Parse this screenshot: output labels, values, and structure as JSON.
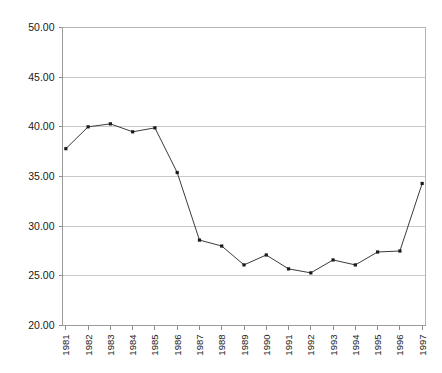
{
  "chart_data": {
    "type": "line",
    "title": "",
    "subtitle": "",
    "xlabel": "",
    "ylabel": "",
    "categories": [
      "1981",
      "1982",
      "1983",
      "1984",
      "1985",
      "1986",
      "1987",
      "1988",
      "1989",
      "1990",
      "1991",
      "1992",
      "1993",
      "1994",
      "1995",
      "1996",
      "1997"
    ],
    "values": [
      37.8,
      40.0,
      40.3,
      39.5,
      39.9,
      35.4,
      28.6,
      28.0,
      26.1,
      27.1,
      25.7,
      25.3,
      26.6,
      26.1,
      27.4,
      27.5,
      34.3
    ],
    "ylim": [
      20.0,
      50.0
    ],
    "ytick_labels": [
      "50.00",
      "45.00",
      "40.00",
      "35.00",
      "30.00",
      "25.00",
      "20.00"
    ],
    "ytick_values": [
      50.0,
      45.0,
      40.0,
      35.0,
      30.0,
      25.0,
      20.0
    ],
    "grid": true,
    "legend": null,
    "legend_position": "none",
    "series_name": "",
    "marker": "square",
    "line_color": "#3b3b3b",
    "marker_color": "#1a1a1a",
    "grid_color": "#c8c8c8",
    "background_color": "#ffffff"
  }
}
